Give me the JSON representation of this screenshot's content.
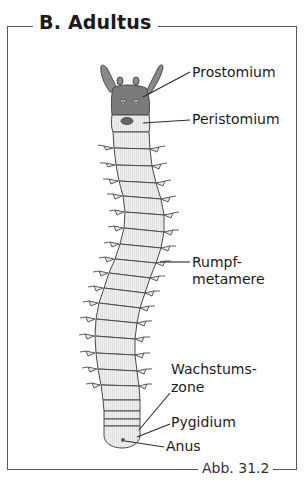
{
  "figure": {
    "title": "B. Adultus",
    "figure_number": "Abb. 31.2"
  },
  "labels": [
    {
      "id": "prostomium",
      "text": "Prostomium"
    },
    {
      "id": "peristomium",
      "text": "Peristomium"
    },
    {
      "id": "rumpfmetamere",
      "line1": "Rumpf-",
      "line2": "metamere"
    },
    {
      "id": "wachstumszone",
      "line1": "Wachstums-",
      "line2": "zone"
    },
    {
      "id": "pygidium",
      "text": "Pygidium"
    },
    {
      "id": "anus",
      "text": "Anus"
    }
  ],
  "colors": {
    "head": "#7a7a7a",
    "body": "#ececec",
    "outline": "#4a4a4a",
    "frame": "#555555"
  }
}
